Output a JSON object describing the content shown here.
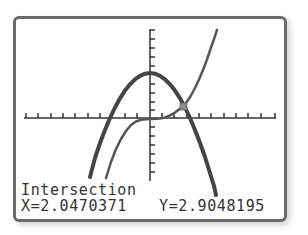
{
  "screen": {
    "mode_label": "Intersection",
    "x_readout": "X=2.0470371",
    "y_readout": "Y=2.9048195"
  },
  "graph": {
    "curves": [
      {
        "name": "parabola",
        "description": "downward-opening parabola, vertex on y-axis",
        "color": "#444444",
        "stroke_width": 4
      },
      {
        "name": "cubic",
        "description": "increasing cubic, flat near origin",
        "color": "#555555",
        "stroke_width": 2.5
      }
    ],
    "intersection": {
      "x": 2.0470371,
      "y": 2.9048195,
      "marker": "square-cursor"
    },
    "axes": {
      "x_ticks_visible": true,
      "y_ticks_visible": true
    }
  },
  "colors": {
    "frame": "#6a6a6a",
    "curve": "#444444",
    "axis": "#333333",
    "cursor": "#8a8a8a",
    "text": "#333333"
  }
}
